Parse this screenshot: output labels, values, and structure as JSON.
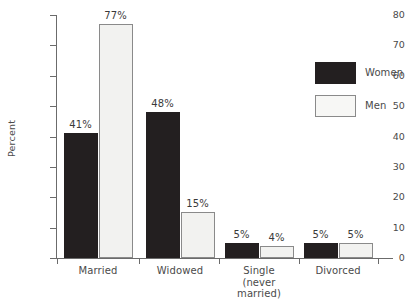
{
  "chart_data": {
    "type": "bar",
    "title": "",
    "xlabel": "",
    "ylabel": "Percent",
    "ylim": [
      0,
      80
    ],
    "ytick_values": [
      80,
      70,
      60,
      50,
      40,
      30,
      20,
      10,
      0
    ],
    "ytick_labels": [
      "80",
      "70",
      "60",
      "50",
      "40",
      "30",
      "20",
      "10",
      "0"
    ],
    "grid": false,
    "legend_position": "right",
    "categories": [
      "Married",
      "Widowed",
      "Single\n(never\nmarried)",
      "Divorced"
    ],
    "series": [
      {
        "name": "Women",
        "color": "#231f20",
        "values": [
          41,
          48,
          5,
          5
        ],
        "value_labels": [
          "41%",
          "48%",
          "5%",
          "5%"
        ]
      },
      {
        "name": "Men",
        "color": "#f2f2f0",
        "values": [
          77,
          15,
          4,
          5
        ],
        "value_labels": [
          "77%",
          "15%",
          "4%",
          "5%"
        ]
      }
    ]
  }
}
